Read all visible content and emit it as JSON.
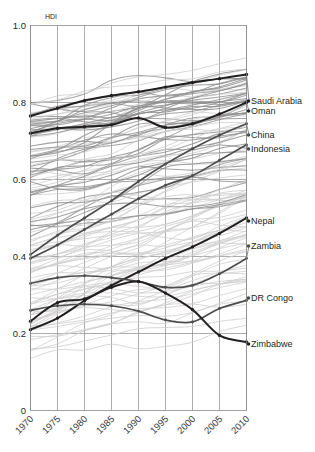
{
  "figure": {
    "axis_title": "HDI",
    "y_ticks": [
      "1.0",
      "0.8",
      "0.6",
      "0.4",
      "0.2",
      "0"
    ],
    "x_ticks": [
      "1970",
      "1975",
      "1980",
      "1985",
      "1990",
      "1995",
      "2000",
      "2005",
      "2010"
    ]
  },
  "colors": {
    "highlight_dark": "#231f20",
    "highlight_mid": "#4d4d4d",
    "background_line_dark": "#8c8c8c",
    "background_line_light": "#cfcfcf",
    "grid": "#8a8a8a",
    "text": "#231f20"
  },
  "labels": [
    {
      "name": "Saudi Arabia",
      "y": 101
    },
    {
      "name": "Oman",
      "y": 111
    },
    {
      "name": "China",
      "y": 135
    },
    {
      "name": "Indonesia",
      "y": 149
    },
    {
      "name": "Nepal",
      "y": 221
    },
    {
      "name": "Zambia",
      "y": 246
    },
    {
      "name": "DR Congo",
      "y": 298
    },
    {
      "name": "Zimbabwe",
      "y": 344
    }
  ],
  "chart_data": {
    "type": "line",
    "title": "",
    "xlabel": "",
    "ylabel": "HDI",
    "xlim": [
      1970,
      2010
    ],
    "ylim": [
      0,
      1.0
    ],
    "grid": true,
    "legend": "right-inline-labels",
    "x": [
      1970,
      1975,
      1980,
      1985,
      1990,
      1995,
      2000,
      2005,
      2010
    ],
    "series": [
      {
        "name": "Saudi Arabia",
        "highlight": true,
        "emphasis": "dark",
        "values": [
          0.765,
          0.785,
          0.805,
          0.818,
          0.828,
          0.84,
          0.852,
          0.862,
          0.873
        ]
      },
      {
        "name": "Oman",
        "highlight": true,
        "emphasis": "dark",
        "values": [
          0.72,
          0.733,
          0.737,
          0.742,
          0.76,
          0.735,
          0.745,
          0.77,
          0.8
        ]
      },
      {
        "name": "China",
        "highlight": true,
        "emphasis": "mid",
        "values": [
          0.405,
          0.455,
          0.5,
          0.545,
          0.595,
          0.64,
          0.68,
          0.715,
          0.745
        ]
      },
      {
        "name": "Indonesia",
        "highlight": true,
        "emphasis": "mid",
        "values": [
          0.395,
          0.43,
          0.47,
          0.51,
          0.55,
          0.585,
          0.61,
          0.65,
          0.69
        ]
      },
      {
        "name": "Nepal",
        "highlight": true,
        "emphasis": "dark",
        "values": [
          0.21,
          0.24,
          0.285,
          0.325,
          0.36,
          0.395,
          0.425,
          0.46,
          0.5
        ]
      },
      {
        "name": "Zambia",
        "highlight": true,
        "emphasis": "mid",
        "values": [
          0.33,
          0.345,
          0.35,
          0.345,
          0.335,
          0.32,
          0.325,
          0.355,
          0.395
        ]
      },
      {
        "name": "DR Congo",
        "highlight": true,
        "emphasis": "mid",
        "values": [
          0.26,
          0.272,
          0.276,
          0.272,
          0.258,
          0.235,
          0.23,
          0.265,
          0.286
        ]
      },
      {
        "name": "Zimbabwe",
        "highlight": true,
        "emphasis": "dark",
        "values": [
          0.232,
          0.28,
          0.29,
          0.32,
          0.335,
          0.305,
          0.262,
          0.195,
          0.178
        ]
      }
    ],
    "background_series_count": 120,
    "note": "Dense spaghetti plot of national HDI trajectories 1970-2010; eight countries highlighted and labelled at the right edge."
  }
}
